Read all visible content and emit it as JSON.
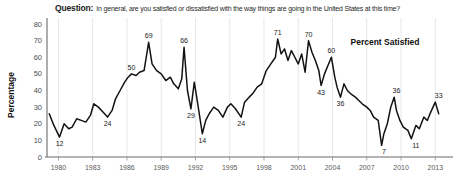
{
  "header": {
    "question_label": "Question:",
    "question_text": "In general, are you satisfied or dissatisfied with the way things are going in the United States at this time?"
  },
  "chart_data": {
    "type": "line",
    "title": "In general, are you satisfied or dissatisfied with the way things are going in the United States at this time?",
    "xlabel": "",
    "ylabel": "Percentage",
    "series_name": "Percent Satisfied",
    "legend_position": "inside-top-right",
    "grid": "vertical",
    "xlim": [
      1979.0,
      2014.2
    ],
    "ylim": [
      0,
      80
    ],
    "yticks": [
      0,
      10,
      20,
      30,
      40,
      50,
      60,
      70,
      80
    ],
    "xticks": [
      1980,
      1983,
      1986,
      1989,
      1992,
      1995,
      1998,
      2001,
      2004,
      2007,
      2010,
      2013
    ],
    "annotations": [
      {
        "x": 1980.1,
        "y": 12,
        "label": "12",
        "place": "below"
      },
      {
        "x": 1984.3,
        "y": 24,
        "label": "24",
        "place": "below"
      },
      {
        "x": 1986.4,
        "y": 50,
        "label": "50",
        "place": "above"
      },
      {
        "x": 1987.9,
        "y": 69,
        "label": "69",
        "place": "above"
      },
      {
        "x": 1991.0,
        "y": 66,
        "label": "66",
        "place": "above"
      },
      {
        "x": 1991.6,
        "y": 29,
        "label": "29",
        "place": "below"
      },
      {
        "x": 1992.6,
        "y": 14,
        "label": "14",
        "place": "below"
      },
      {
        "x": 1996.0,
        "y": 24,
        "label": "24",
        "place": "below"
      },
      {
        "x": 1999.2,
        "y": 71,
        "label": "71",
        "place": "above"
      },
      {
        "x": 2001.9,
        "y": 70,
        "label": "70",
        "place": "above"
      },
      {
        "x": 2003.0,
        "y": 43,
        "label": "43",
        "place": "below"
      },
      {
        "x": 2003.9,
        "y": 60,
        "label": "60",
        "place": "above"
      },
      {
        "x": 2004.7,
        "y": 36,
        "label": "36",
        "place": "below"
      },
      {
        "x": 2008.5,
        "y": 7,
        "label": "7",
        "place": "below"
      },
      {
        "x": 2009.6,
        "y": 36,
        "label": "36",
        "place": "above"
      },
      {
        "x": 2011.3,
        "y": 11,
        "label": "11",
        "place": "below"
      },
      {
        "x": 2013.3,
        "y": 33,
        "label": "33",
        "place": "above"
      }
    ],
    "x": [
      1979.2,
      1979.6,
      1980.1,
      1980.5,
      1980.9,
      1981.2,
      1981.6,
      1982.0,
      1982.4,
      1982.8,
      1983.1,
      1983.5,
      1983.9,
      1984.3,
      1984.7,
      1985.0,
      1985.4,
      1985.8,
      1986.1,
      1986.4,
      1986.8,
      1987.1,
      1987.5,
      1987.9,
      1988.2,
      1988.6,
      1989.0,
      1989.4,
      1989.8,
      1990.1,
      1990.5,
      1990.8,
      1991.0,
      1991.3,
      1991.6,
      1991.9,
      1992.2,
      1992.6,
      1992.9,
      1993.2,
      1993.6,
      1994.0,
      1994.4,
      1994.8,
      1995.1,
      1995.5,
      1996.0,
      1996.3,
      1996.7,
      1997.0,
      1997.4,
      1997.8,
      1998.2,
      1998.6,
      1999.0,
      1999.2,
      1999.5,
      1999.8,
      2000.1,
      2000.4,
      2000.7,
      2001.0,
      2001.3,
      2001.6,
      2001.9,
      2002.2,
      2002.5,
      2002.8,
      2003.0,
      2003.3,
      2003.6,
      2003.9,
      2004.2,
      2004.4,
      2004.7,
      2005.0,
      2005.3,
      2005.6,
      2006.0,
      2006.3,
      2006.6,
      2007.0,
      2007.3,
      2007.6,
      2008.0,
      2008.3,
      2008.5,
      2008.8,
      2009.1,
      2009.4,
      2009.6,
      2009.9,
      2010.2,
      2010.6,
      2010.9,
      2011.3,
      2011.6,
      2012.0,
      2012.3,
      2012.6,
      2013.0,
      2013.3,
      2013.6
    ],
    "y": [
      26,
      19,
      12,
      20,
      17,
      18,
      23,
      22,
      21,
      25,
      32,
      30,
      27,
      24,
      28,
      35,
      40,
      45,
      48,
      50,
      49,
      51,
      52,
      69,
      56,
      52,
      50,
      46,
      48,
      44,
      41,
      47,
      66,
      40,
      29,
      45,
      32,
      14,
      22,
      26,
      30,
      28,
      24,
      30,
      32,
      29,
      24,
      33,
      36,
      38,
      42,
      44,
      52,
      56,
      60,
      71,
      62,
      65,
      58,
      64,
      60,
      56,
      62,
      51,
      70,
      63,
      58,
      52,
      43,
      50,
      55,
      60,
      48,
      42,
      36,
      44,
      40,
      38,
      36,
      34,
      32,
      30,
      28,
      24,
      22,
      7,
      14,
      20,
      30,
      36,
      28,
      22,
      18,
      16,
      11,
      19,
      17,
      24,
      22,
      27,
      33,
      26
    ]
  }
}
